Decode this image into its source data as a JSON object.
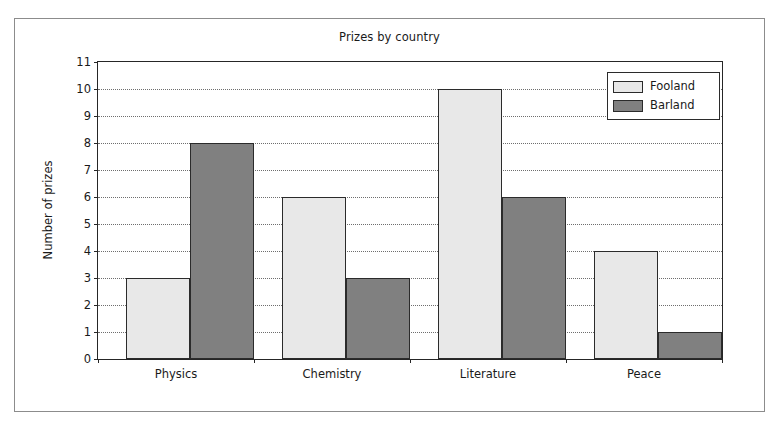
{
  "chart_data": {
    "type": "bar",
    "title": "Prizes by country",
    "xlabel": "",
    "ylabel": "Number of prizes",
    "categories": [
      "Physics",
      "Chemistry",
      "Literature",
      "Peace"
    ],
    "series": [
      {
        "name": "Fooland",
        "values": [
          3,
          6,
          10,
          4
        ],
        "color": "#e8e8e8"
      },
      {
        "name": "Barland",
        "values": [
          8,
          3,
          6,
          1
        ],
        "color": "#808080"
      }
    ],
    "ylim": [
      0,
      11
    ],
    "yticks": [
      0,
      1,
      2,
      3,
      4,
      5,
      6,
      7,
      8,
      9,
      10,
      11
    ],
    "ytick_labels": [
      "0",
      "1",
      "2",
      "3",
      "4",
      "5",
      "6",
      "7",
      "8",
      "9",
      "10",
      "11"
    ],
    "grid": true,
    "grid_axis": "y",
    "grid_style": "dotted",
    "legend_position": "upper right",
    "legend_entries": [
      "Fooland",
      "Barland"
    ],
    "bar_edge_color": "#2b2b2b",
    "axes_color": "#262626",
    "background_color": "#ffffff"
  }
}
